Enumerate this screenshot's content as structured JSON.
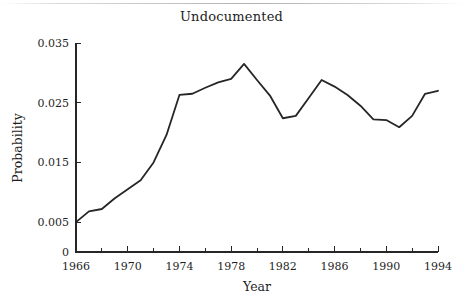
{
  "chart_data": {
    "type": "line",
    "title": "Undocumented",
    "xlabel": "Year",
    "ylabel": "Probability",
    "xlim": [
      1966,
      1994
    ],
    "ylim": [
      0,
      0.035
    ],
    "grid": false,
    "legend": null,
    "x_ticks_major": [
      "1966",
      "1970",
      "1974",
      "1978",
      "1982",
      "1986",
      "1990",
      "1994"
    ],
    "x_ticks_major_values": [
      1966,
      1970,
      1974,
      1978,
      1982,
      1986,
      1990,
      1994
    ],
    "x_ticks_minor_values": [
      1968,
      1972,
      1976,
      1980,
      1984,
      1988,
      1992
    ],
    "y_ticks": [
      "0",
      "0.005",
      "0.015",
      "0.025",
      "0.035"
    ],
    "y_tick_values": [
      0,
      0.005,
      0.015,
      0.025,
      0.035
    ],
    "line_color": "#262626",
    "series": [
      {
        "name": "Undocumented",
        "x": [
          1966,
          1967,
          1968,
          1969,
          1970,
          1971,
          1972,
          1973,
          1974,
          1975,
          1976,
          1977,
          1978,
          1979,
          1980,
          1981,
          1982,
          1983,
          1984,
          1985,
          1986,
          1987,
          1988,
          1989,
          1990,
          1991,
          1992,
          1993,
          1994
        ],
        "values": [
          0.005,
          0.0068,
          0.0072,
          0.009,
          0.0105,
          0.012,
          0.015,
          0.0196,
          0.0263,
          0.0265,
          0.0275,
          0.0284,
          0.029,
          0.0315,
          0.0288,
          0.0262,
          0.0224,
          0.0228,
          0.0258,
          0.0288,
          0.0277,
          0.0263,
          0.0245,
          0.0222,
          0.0221,
          0.0209,
          0.0228,
          0.0265,
          0.027
        ]
      }
    ]
  }
}
